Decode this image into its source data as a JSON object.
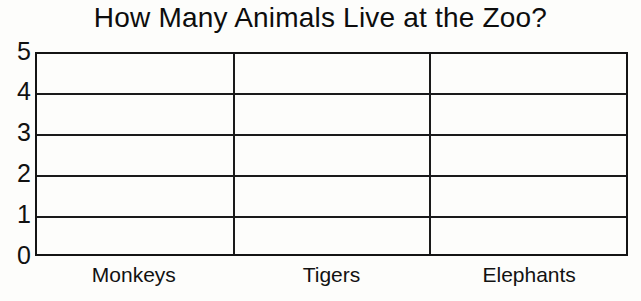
{
  "chart_data": {
    "type": "bar",
    "title": "How Many Animals Live at the Zoo?",
    "subtitle": "",
    "xlabel": "",
    "ylabel": "",
    "categories": [
      "Monkeys",
      "Tigers",
      "Elephants"
    ],
    "values": [
      null,
      null,
      null
    ],
    "series": [
      {
        "name": "Number of animals",
        "values": [
          null,
          null,
          null
        ]
      }
    ],
    "ylim": [
      0,
      5
    ],
    "ytick_labels": [
      "0",
      "1",
      "2",
      "3",
      "4",
      "5"
    ],
    "ytick_values": [
      0,
      1,
      2,
      3,
      4,
      5
    ],
    "ytick_interval": 1,
    "grid": true,
    "grid_orientation": "horizontal-and-vertical",
    "legend": false,
    "legend_position": "none",
    "bars_drawn": false,
    "note": "Blank worksheet grid - no bars are plotted; students fill them in",
    "annotations": [],
    "colors": {
      "background": "#fdfdfb",
      "grid_line": "#1a1a1a",
      "axis_line": "#141414",
      "text": "#111111"
    }
  },
  "axis": {
    "y_labels": [
      {
        "text": "5",
        "value": 5
      },
      {
        "text": "4",
        "value": 4
      },
      {
        "text": "3",
        "value": 3
      },
      {
        "text": "2",
        "value": 2
      },
      {
        "text": "1",
        "value": 1
      },
      {
        "text": "0",
        "value": 0
      }
    ],
    "x_labels": [
      {
        "text": "Monkeys"
      },
      {
        "text": "Tigers"
      },
      {
        "text": "Elephants"
      }
    ]
  }
}
